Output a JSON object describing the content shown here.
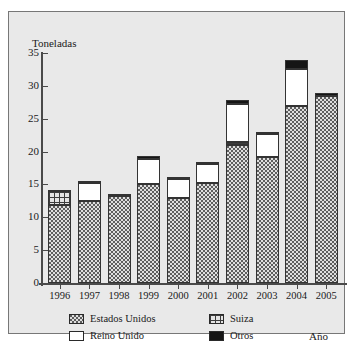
{
  "chart_data": {
    "type": "bar",
    "subtype": "stacked-bar",
    "title": "",
    "xlabel": "Año",
    "ylabel": "Toneladas",
    "ylim": [
      0,
      35
    ],
    "yticks": [
      0,
      5,
      10,
      15,
      20,
      25,
      30,
      35
    ],
    "ytick_labels": [
      "0",
      "5",
      "10",
      "15",
      "20",
      "25",
      "30",
      "35"
    ],
    "grid": false,
    "legend_position": "bottom",
    "categories": [
      "1996",
      "1997",
      "1998",
      "1999",
      "2000",
      "2001",
      "2002",
      "2003",
      "2004",
      "2005"
    ],
    "series": [
      {
        "name": "Estados Unidos",
        "pattern": "dotted",
        "color": "#dedede",
        "values": [
          11.8,
          12.5,
          13.3,
          15.1,
          12.9,
          15.2,
          21.0,
          19.1,
          27.0,
          28.4
        ]
      },
      {
        "name": "Suiza",
        "pattern": "crosshatch-grid",
        "color": "#e4e4e4",
        "values": [
          2.2,
          0.0,
          0.0,
          0.0,
          0.0,
          0.0,
          0.5,
          0.0,
          0.0,
          0.0
        ]
      },
      {
        "name": "Reino Unido",
        "pattern": "solid-white",
        "color": "#ffffff",
        "values": [
          0.0,
          2.7,
          0.0,
          3.7,
          2.9,
          2.9,
          5.8,
          3.5,
          5.5,
          0.0
        ]
      },
      {
        "name": "Otros",
        "pattern": "solid-black",
        "color": "#151515",
        "values": [
          0.2,
          0.3,
          0.3,
          0.5,
          0.4,
          0.3,
          0.5,
          0.4,
          1.5,
          0.5
        ]
      }
    ],
    "totals": [
      14.2,
      15.5,
      13.6,
      19.3,
      16.2,
      18.4,
      27.8,
      23.0,
      34.0,
      28.9
    ]
  },
  "legend": {
    "entries": [
      {
        "label": "Estados Unidos",
        "swatch": "dotted-swatch"
      },
      {
        "label": "Suiza",
        "swatch": "grid-swatch"
      },
      {
        "label": "Reino Unido",
        "swatch": "white-swatch"
      },
      {
        "label": "Otros",
        "swatch": "black-swatch"
      }
    ]
  }
}
